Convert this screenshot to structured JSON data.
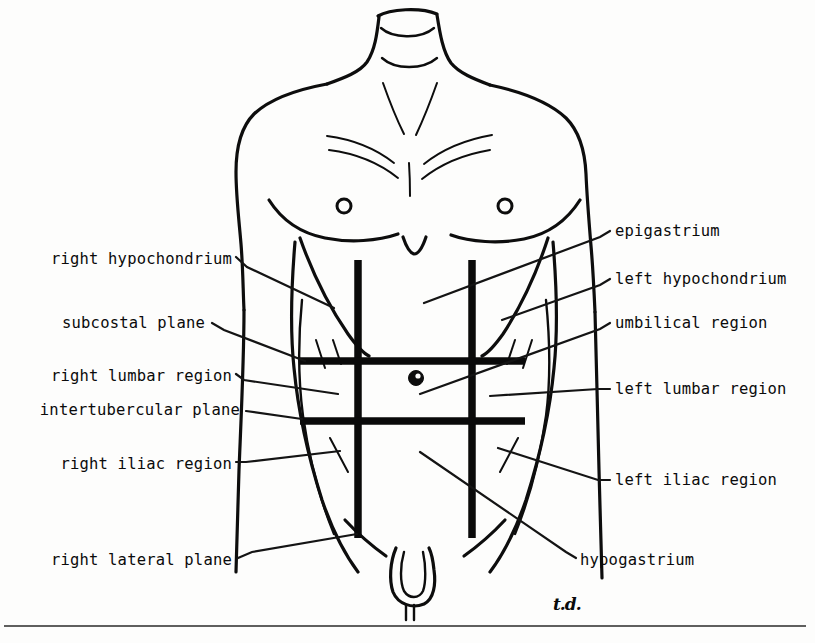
{
  "figure": {
    "signature": "t.d.",
    "line_color": "#0d0d0d",
    "background_color": "#fdfdfc"
  },
  "labels_left": [
    {
      "id": "right-hypochondrium",
      "text": "right hypochondrium",
      "x_end": 232,
      "y": 262
    },
    {
      "id": "subcostal-plane",
      "text": "subcostal plane",
      "x_end": 205,
      "y": 326
    },
    {
      "id": "right-lumbar-region",
      "text": "right lumbar region",
      "x_end": 232,
      "y": 379
    },
    {
      "id": "intertubercular-plane",
      "text": "intertubercular plane",
      "x_end": 240,
      "y": 413
    },
    {
      "id": "right-iliac-region",
      "text": "right iliac region",
      "x_end": 232,
      "y": 467
    },
    {
      "id": "right-lateral-plane",
      "text": "right lateral plane",
      "x_end": 232,
      "y": 563
    }
  ],
  "labels_right": [
    {
      "id": "epigastrium",
      "text": "epigastrium",
      "x_start": 615,
      "y": 234
    },
    {
      "id": "left-hypochondrium",
      "text": "left hypochondrium",
      "x_start": 615,
      "y": 282
    },
    {
      "id": "umbilical-region",
      "text": "umbilical region",
      "x_start": 615,
      "y": 326
    },
    {
      "id": "left-lumbar-region",
      "text": "left lumbar region",
      "x_start": 615,
      "y": 392
    },
    {
      "id": "left-iliac-region",
      "text": "left iliac region",
      "x_start": 615,
      "y": 483
    },
    {
      "id": "hypogastrium",
      "text": "hypogastrium",
      "x_start": 580,
      "y": 563
    }
  ],
  "planes": {
    "vertical": [
      {
        "id": "right-lateral-plane-line",
        "x": 358,
        "y1": 260,
        "y2": 538
      },
      {
        "id": "left-lateral-plane-line",
        "x": 472,
        "y1": 260,
        "y2": 538
      }
    ],
    "horizontal": [
      {
        "id": "subcostal-plane-line",
        "y": 361,
        "x1": 300,
        "x2": 525
      },
      {
        "id": "intertubercular-plane-line",
        "y": 421,
        "x1": 300,
        "x2": 525
      }
    ]
  },
  "anatomy": {
    "navel": {
      "cx": 416,
      "cy": 378,
      "r": 7
    },
    "nipple_right": {
      "cx": 344,
      "cy": 206,
      "r": 7
    },
    "nipple_left": {
      "cx": 505,
      "cy": 206,
      "r": 7
    }
  },
  "regions": [
    "right hypochondrium",
    "epigastrium",
    "left hypochondrium",
    "right lumbar region",
    "umbilical region",
    "left lumbar region",
    "right iliac region",
    "hypogastrium",
    "left iliac region"
  ],
  "planes_named": [
    "subcostal plane",
    "intertubercular plane",
    "right lateral plane",
    "left lateral plane"
  ]
}
